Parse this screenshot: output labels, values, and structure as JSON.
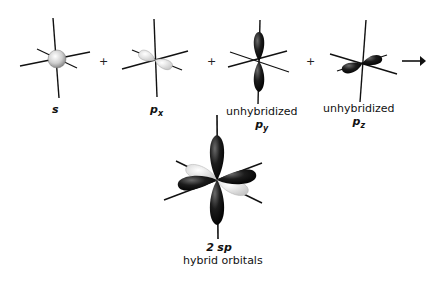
{
  "diagram": {
    "top_row": [
      {
        "id": "s",
        "symbol": "s",
        "subscript": "",
        "caption": ""
      },
      {
        "id": "px",
        "symbol": "p",
        "subscript": "x",
        "caption": ""
      },
      {
        "id": "py",
        "symbol": "p",
        "subscript": "y",
        "caption": "unhybridized"
      },
      {
        "id": "pz",
        "symbol": "p",
        "subscript": "z",
        "caption": "unhybridized"
      }
    ],
    "operators": [
      "+",
      "+",
      "+"
    ],
    "arrow": "→",
    "result": {
      "line1_number": "2",
      "line1_symbol": "sp",
      "line2": "hybrid orbitals"
    },
    "colors": {
      "light_lobe": "#e6e6e6",
      "dark_lobe": "#1a1a1a",
      "axis": "#111111"
    }
  }
}
